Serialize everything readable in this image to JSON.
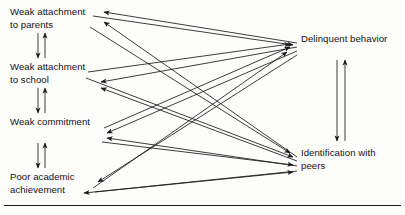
{
  "figure": {
    "line_color": "#1a1a1a",
    "background_color": "#fdfdfc",
    "width": 405,
    "height": 215
  },
  "nodes": [
    {
      "id": "parents",
      "label": "Weak attachment\nto parents",
      "side": "left",
      "x": 10,
      "y": 6
    },
    {
      "id": "school",
      "label": "Weak attachment\nto school",
      "side": "left",
      "x": 10,
      "y": 61
    },
    {
      "id": "commit",
      "label": "Weak commitment",
      "side": "left",
      "x": 10,
      "y": 116
    },
    {
      "id": "academic",
      "label": "Poor academic\nachievement",
      "side": "left",
      "x": 10,
      "y": 171
    },
    {
      "id": "delinq",
      "label": "Delinquent behavior",
      "side": "right",
      "x": 301,
      "y": 33
    },
    {
      "id": "peers",
      "label": "Identification with\npeers",
      "side": "right",
      "x": 301,
      "y": 147
    }
  ],
  "edges": [
    {
      "from": "delinq",
      "to": "parents",
      "style": "single",
      "note": "delinquent behavior weakens attachment to parents"
    },
    {
      "from": "peers",
      "to": "parents",
      "style": "single",
      "note": "peer identification weakens attachment to parents"
    },
    {
      "from": "delinq",
      "to": "school",
      "style": "single",
      "note": "delinquent behavior weakens attachment to school"
    },
    {
      "from": "peers",
      "to": "school",
      "style": "single",
      "note": "peer identification weakens attachment to school"
    },
    {
      "from": "delinq",
      "to": "commit",
      "style": "single",
      "note": "delinquent behavior weakens commitment"
    },
    {
      "from": "peers",
      "to": "commit",
      "style": "single",
      "note": "peer identification weakens commitment"
    },
    {
      "from": "delinq",
      "to": "academic",
      "style": "single",
      "note": "delinquent behavior lowers academic achievement"
    },
    {
      "from": "peers",
      "to": "academic",
      "style": "single",
      "note": "peer identification lowers academic achievement"
    },
    {
      "from": "parents",
      "to": "delinq",
      "style": "single",
      "note": "weak attachment to parents leads to delinquency"
    },
    {
      "from": "school",
      "to": "delinq",
      "style": "single",
      "note": "weak attachment to school leads to delinquency"
    },
    {
      "from": "commit",
      "to": "delinq",
      "style": "single",
      "note": "weak commitment leads to delinquency"
    },
    {
      "from": "academic",
      "to": "delinq",
      "style": "single",
      "note": "poor achievement leads to delinquency"
    },
    {
      "from": "parents",
      "to": "peers",
      "style": "single",
      "note": "weak attachment to parents leads to peer identification"
    },
    {
      "from": "school",
      "to": "peers",
      "style": "single",
      "note": "weak attachment to school leads to peer identification"
    },
    {
      "from": "commit",
      "to": "peers",
      "style": "single",
      "note": "weak commitment leads to peer identification"
    },
    {
      "from": "academic",
      "to": "peers",
      "style": "single",
      "note": "poor achievement leads to peer identification"
    },
    {
      "from": "parents",
      "to": "school",
      "style": "double",
      "note": "reciprocal link, vertical"
    },
    {
      "from": "school",
      "to": "commit",
      "style": "double",
      "note": "reciprocal link, vertical"
    },
    {
      "from": "commit",
      "to": "academic",
      "style": "double",
      "note": "reciprocal link, vertical"
    },
    {
      "from": "delinq",
      "to": "peers",
      "style": "double",
      "note": "reciprocal link, vertical"
    }
  ],
  "rules": [
    {
      "id": "bottom-rule",
      "orientation": "horizontal",
      "y": 205
    }
  ]
}
